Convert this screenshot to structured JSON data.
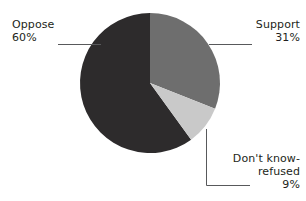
{
  "chart_data": {
    "type": "pie",
    "title": "",
    "categories": [
      "Support",
      "Don't know-refused",
      "Oppose"
    ],
    "values": [
      31,
      9,
      60
    ],
    "units": "%",
    "start_angle_deg": 0,
    "direction": "clockwise",
    "legend": "none",
    "labels": [
      {
        "key": "support",
        "name": "Support",
        "value_label": "31%",
        "value": 31,
        "color": "#6e6e6e",
        "position": "right-top",
        "leader": "horizontal"
      },
      {
        "key": "dont_know",
        "name": "Don't know-",
        "name_line2": "refused",
        "value_label": "9%",
        "value": 9,
        "color": "#c9c9c9",
        "position": "right-bottom",
        "leader": "elbow"
      },
      {
        "key": "oppose",
        "name": "Oppose",
        "value_label": "60%",
        "value": 60,
        "color": "#2d2b2c",
        "position": "left-top",
        "leader": "horizontal"
      }
    ],
    "colors": {
      "support": "#6e6e6e",
      "dont_know": "#c9c9c9",
      "oppose": "#2d2b2c",
      "leader_line": "#58595b",
      "background": "#ffffff",
      "text": "#231f20"
    },
    "geometry": {
      "center_x": 150,
      "center_y": 83,
      "radius": 70
    }
  }
}
